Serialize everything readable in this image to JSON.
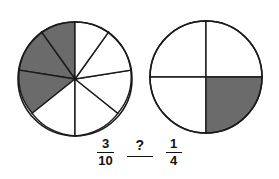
{
  "page": {
    "background_color": "#ffffff",
    "stroke_color": "#1a1a1a",
    "shade_color": "#6b6b6b",
    "fill_color": "#ffffff"
  },
  "figures": {
    "left_circle": {
      "name": "ten-part-fraction-circle",
      "cx": 75,
      "cy": 79,
      "r": 57,
      "total_parts": 10,
      "shaded_parts": 3,
      "fraction_text": "3/10",
      "start_angle_deg": -90,
      "direction": "counterclockwise"
    },
    "right_circle": {
      "name": "four-part-fraction-circle",
      "cx": 206,
      "cy": 77,
      "r": 56,
      "total_parts": 4,
      "shaded_parts": 1,
      "fraction_text": "1/4",
      "shaded_quadrant": "bottom-right"
    }
  },
  "expression": {
    "left_fraction": {
      "numerator": "3",
      "denominator": "10"
    },
    "comparison_blank": {
      "symbol": "?"
    },
    "right_fraction": {
      "numerator": "1",
      "denominator": "4"
    }
  }
}
